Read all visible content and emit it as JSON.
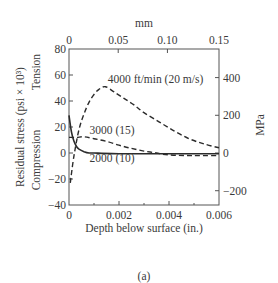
{
  "chart_data": {
    "type": "line",
    "title": "",
    "caption": "(a)",
    "xlabel": "Depth below surface (in.)",
    "x2label": "mm",
    "ylabel": "Residual stress (psi × 10³)",
    "ylabel_upper": "Tension",
    "ylabel_lower": "Compression",
    "y2label": "MPa",
    "xlim": [
      0,
      0.006
    ],
    "ylim": [
      -40,
      80
    ],
    "x_ticks": [
      0,
      0.002,
      0.004,
      0.006
    ],
    "x_tick_labels": [
      "0",
      "0.002",
      "0.004",
      "0.006"
    ],
    "x_minor_ticks": [
      0.001,
      0.003,
      0.005
    ],
    "y_ticks": [
      -40,
      -20,
      0,
      20,
      40,
      60,
      80
    ],
    "y_tick_labels": [
      "−40",
      "−20",
      "0",
      "20",
      "40",
      "60",
      "80"
    ],
    "x2_ticks_mm": [
      0,
      0.05,
      0.1,
      0.15
    ],
    "x2_tick_labels": [
      "0",
      "0.05",
      "0.10",
      "0.15"
    ],
    "y2_ticks_mpa": [
      -200,
      0,
      200,
      400
    ],
    "y2_tick_labels": [
      "−200",
      "0",
      "200",
      "400"
    ],
    "grid": false,
    "series": [
      {
        "name": "4000 ft/min (20 m/s)",
        "style": "dashed",
        "x": [
          5e-05,
          0.0002,
          0.0004,
          0.0006,
          0.0008,
          0.001,
          0.0012,
          0.00145,
          0.0018,
          0.0022,
          0.0026,
          0.003,
          0.0036,
          0.0042,
          0.0048,
          0.0054,
          0.006
        ],
        "y": [
          -23,
          -2,
          18,
          30,
          39,
          45,
          49,
          51,
          47,
          42,
          37,
          31,
          24,
          17,
          11,
          7,
          4
        ]
      },
      {
        "name": "3000 (15)",
        "style": "dashed",
        "x": [
          0.0,
          0.0003,
          0.0006,
          0.001,
          0.0015,
          0.002,
          0.0025,
          0.003,
          0.0035,
          0.004,
          0.005,
          0.006
        ],
        "y": [
          12,
          12,
          12.5,
          11,
          9,
          6,
          3.5,
          1.5,
          0,
          -1.5,
          -2,
          -2
        ]
      },
      {
        "name": "2000 (10)",
        "style": "solid",
        "x": [
          0,
          0.0001,
          0.0002,
          0.0003,
          0.0004,
          0.0006,
          0.0008,
          0.001,
          0.002,
          0.006
        ],
        "y": [
          29,
          16,
          9,
          5,
          3,
          1,
          0,
          0,
          -0.5,
          -0.5
        ]
      }
    ],
    "annotations": [
      {
        "text": "4000 ft/min (20 m/s)",
        "x": 0.00155,
        "y": 54
      },
      {
        "text": "3000 (15)",
        "x": 0.00082,
        "y": 15
      },
      {
        "text": "2000 (10)",
        "x": 0.00082,
        "y": -7
      }
    ],
    "colors": {
      "line": "#2b2b2b",
      "axis": "#555555",
      "text": "#3a3a3a"
    }
  }
}
